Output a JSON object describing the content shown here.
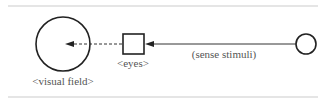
{
  "diagram": {
    "nodes": [
      {
        "id": "visual-field",
        "shape": "circle",
        "label": "<visual field>"
      },
      {
        "id": "eyes",
        "shape": "square",
        "label": "<eyes>"
      },
      {
        "id": "source",
        "shape": "circle",
        "label": ""
      }
    ],
    "edges": [
      {
        "from": "source",
        "to": "eyes",
        "style": "solid",
        "label": "(sense stimuli)"
      },
      {
        "from": "eyes",
        "to": "visual-field",
        "style": "dashed",
        "label": ""
      }
    ],
    "colors": {
      "stroke": "#222222",
      "rule": "#dddddd",
      "text": "#555555"
    }
  }
}
